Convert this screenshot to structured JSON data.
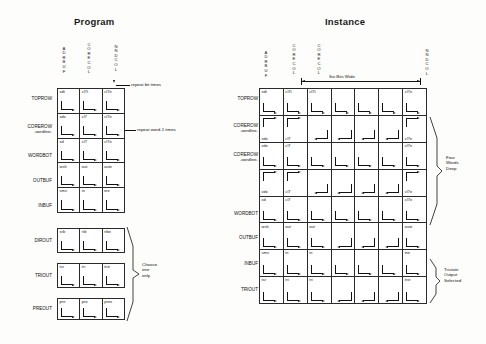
{
  "document": {
    "kind": "technical-diagram",
    "ink_color": "#111111",
    "paper_color": "#fdfdfb"
  },
  "program": {
    "title": "Program",
    "column_headers": [
      "ADRBUF",
      "CORECOL",
      "NNDCOL"
    ],
    "row_labels": [
      {
        "name": "TOPROW",
        "sub": ""
      },
      {
        "name": "COREROW",
        "sub": "-wordline-"
      },
      {
        "name": "WORDBOT",
        "sub": ""
      },
      {
        "name": "OUTBUF",
        "sub": ""
      },
      {
        "name": "INBUF",
        "sub": ""
      },
      {
        "name": "DIROUT",
        "sub": ""
      },
      {
        "name": "TRIOUT",
        "sub": ""
      },
      {
        "name": "PREOUT",
        "sub": ""
      }
    ],
    "block_a_cells": [
      [
        "xdt",
        "cl7t",
        "cl7e"
      ],
      [
        "xdx",
        "cl7",
        "cl7e"
      ],
      [
        "xd",
        "cl7",
        "cl7e"
      ],
      [
        "wsh",
        "out",
        "oute"
      ],
      [
        "smv",
        "in",
        "ine"
      ]
    ],
    "block_b_cells": [
      [
        "srb",
        "rib",
        "ribe"
      ]
    ],
    "block_c_cells": [
      [
        "tsr",
        "tri",
        "trie"
      ]
    ],
    "block_d_cells": [
      [
        "pre",
        "pre",
        "pree"
      ]
    ],
    "annotations": {
      "repeat_bit": "repeat  bit  times",
      "repeat_word": "repeat  word-1  times",
      "choose_one": "Choose\none\nonly"
    }
  },
  "instance": {
    "title": "Instance",
    "column_headers": [
      "ADRBUF",
      "CORECOL",
      "CORECOL",
      "",
      "",
      "",
      "NNDCOL"
    ],
    "row_labels": [
      {
        "name": "TOPROW",
        "sub": ""
      },
      {
        "name": "COREROW",
        "sub": "-wordline-"
      },
      {
        "name": "COREROW",
        "sub": "-wordline-"
      },
      {
        "name": "",
        "sub": ""
      },
      {
        "name": "WORDBOT",
        "sub": ""
      },
      {
        "name": "OUTBUF",
        "sub": ""
      },
      {
        "name": "INBUF",
        "sub": ""
      },
      {
        "name": "TRIOUT",
        "sub": ""
      }
    ],
    "cells": [
      [
        "xdt",
        "cl7t",
        "cl7t",
        "",
        "",
        "",
        "cl7e"
      ],
      [
        "xdx",
        "cl7",
        "",
        "",
        "",
        "",
        "cl7e"
      ],
      [
        "xdx",
        "cl7",
        "",
        "",
        "",
        "",
        "cl7e"
      ],
      [
        "xdx",
        "cl7",
        "",
        "",
        "",
        "",
        "cl7e"
      ],
      [
        "xd",
        "cl7",
        "",
        "",
        "",
        "",
        "cl7e"
      ],
      [
        "wsh",
        "out",
        "out",
        "",
        "",
        "",
        "oute"
      ],
      [
        "smv",
        "in",
        "in",
        "",
        "",
        "",
        "ine"
      ],
      [
        "tsr",
        "tri",
        "tri",
        "",
        "",
        "",
        "trie"
      ]
    ],
    "annotations": {
      "six_bits_wide": "Six Bits Wide",
      "four_words_deep": "Four\nWords\nDeep",
      "tristate_output": "Tristate\nOutput\nSelected"
    }
  }
}
